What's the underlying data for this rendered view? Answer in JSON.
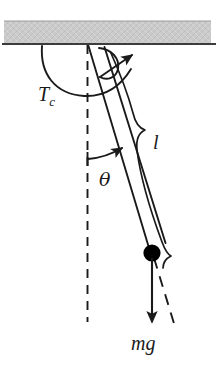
{
  "figure": {
    "background_color": "#ffffff",
    "ink_color": "#1a1a1a",
    "ceiling_color": "#c9c9c9",
    "ceiling_edge_color": "#555555",
    "bob_color": "#000000"
  },
  "labels": {
    "tension_symbol": "T",
    "tension_subscript": "c",
    "length_symbol": "l",
    "angle_symbol": "θ",
    "weight_symbol": "mg"
  },
  "elements": {
    "ceiling": "support-ceiling",
    "pivot": "pivot-point",
    "rod": "pendulum-rod",
    "bob": "pendulum-bob",
    "vertical_reference": "vertical-dashed-line",
    "rod_extension": "rod-extension-dashed-line",
    "torque_arc": "torque-arc-arrow",
    "tension_arc": "tension-arc-arrow",
    "angle_arc": "angle-arc-arrow",
    "weight_arrow": "weight-force-arrow",
    "length_brace": "length-brace"
  }
}
